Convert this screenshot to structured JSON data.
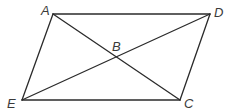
{
  "diagram": {
    "type": "geometry",
    "stroke_color": "#2b2b2b",
    "label_color": "#3a3a3a",
    "points": {
      "A": {
        "label": "A",
        "x": 53,
        "y": 14,
        "lx": 41,
        "ly": 15
      },
      "D": {
        "label": "D",
        "x": 210,
        "y": 14,
        "lx": 214,
        "ly": 17
      },
      "E": {
        "label": "E",
        "x": 22,
        "y": 100,
        "lx": 7,
        "ly": 108
      },
      "C": {
        "label": "C",
        "x": 180,
        "y": 100,
        "lx": 184,
        "ly": 108
      },
      "B": {
        "label": "B",
        "x": 116,
        "y": 59,
        "lx": 112,
        "ly": 51
      }
    },
    "segments": [
      {
        "from": "A",
        "to": "D"
      },
      {
        "from": "D",
        "to": "C"
      },
      {
        "from": "C",
        "to": "E"
      },
      {
        "from": "E",
        "to": "A"
      },
      {
        "from": "A",
        "to": "C"
      },
      {
        "from": "E",
        "to": "D"
      }
    ]
  }
}
